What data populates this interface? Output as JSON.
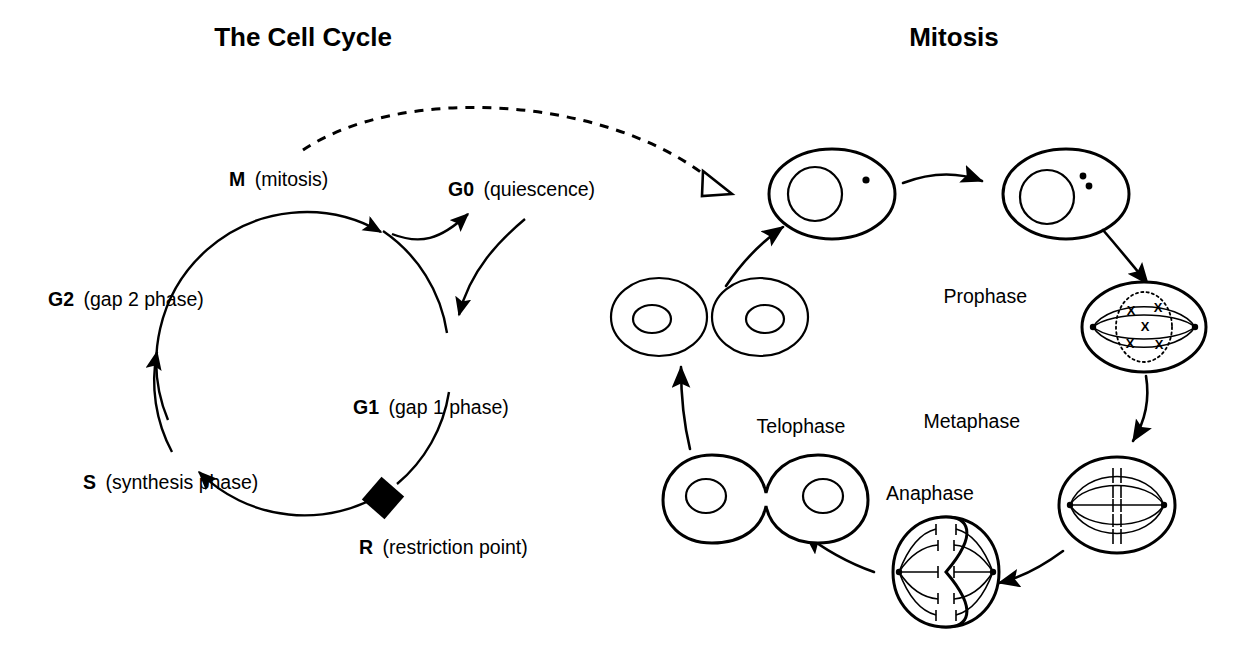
{
  "figure": {
    "background_color": "#ffffff",
    "ink_color": "#000000"
  },
  "cell_cycle": {
    "title": "The Cell Cycle",
    "phases": [
      {
        "id": "M",
        "abbr": "M",
        "name": "(mitosis)"
      },
      {
        "id": "G0",
        "abbr": "G0",
        "name": "(quiescence)"
      },
      {
        "id": "G1",
        "abbr": "G1",
        "name": "(gap 1 phase)"
      },
      {
        "id": "R",
        "abbr": "R",
        "name": "(restriction point)"
      },
      {
        "id": "S",
        "abbr": "S",
        "name": "(synthesis phase)"
      },
      {
        "id": "G2",
        "abbr": "G2",
        "name": "(gap 2 phase)"
      }
    ],
    "marker": {
      "name": "restriction-point",
      "shape": "filled-diamond"
    }
  },
  "mitosis": {
    "title": "Mitosis",
    "stages": [
      {
        "id": "interphase-g1",
        "label": "",
        "centrosomes": 1,
        "note": "interphase cell, single centrosome"
      },
      {
        "id": "interphase-s-g2",
        "label": "",
        "centrosomes": 2,
        "note": "interphase cell, duplicated centrosomes"
      },
      {
        "id": "prophase",
        "label": "Prophase",
        "chromosomes": 5,
        "note": "dotted nuclear envelope, X chromosomes"
      },
      {
        "id": "metaphase",
        "label": "Metaphase",
        "chromosomes": 5,
        "note": "chromosomes aligned at metaphase plate"
      },
      {
        "id": "anaphase",
        "label": "Anaphase",
        "chromosomes": 5,
        "note": "sister chromatids pulled to poles, cleavage furrow"
      },
      {
        "id": "telophase",
        "label": "Telophase",
        "note": "two nuclei reforming, cell pinching"
      },
      {
        "id": "daughter-cells",
        "label": "",
        "note": "two separate daughter cells"
      }
    ]
  },
  "connectors": {
    "dashed_link": {
      "name": "cell-cycle-to-mitosis-link",
      "style": "dashed",
      "arrowhead": "hollow-triangle"
    }
  }
}
